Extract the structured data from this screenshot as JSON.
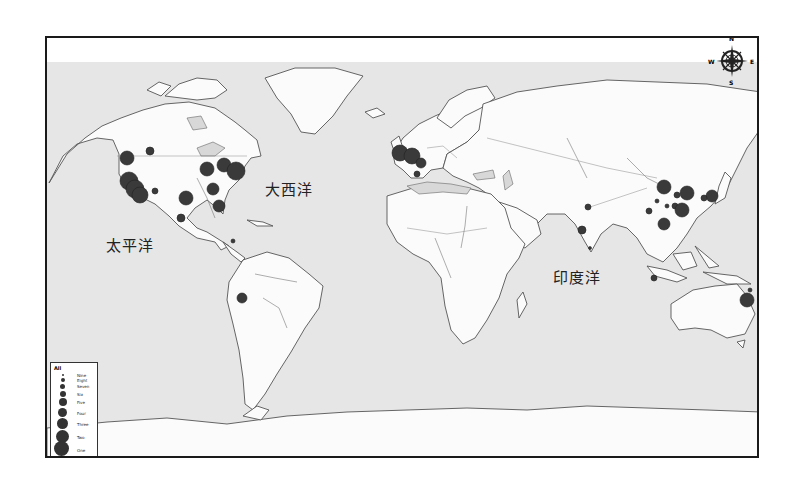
{
  "map": {
    "ocean_labels": {
      "pacific": "太平洋",
      "atlantic": "大西洋",
      "indian": "印度洋"
    },
    "colors": {
      "ocean": "#e6e6e6",
      "land": "#fbfbfb",
      "point": "#3a3a3a",
      "frame": "#1a1a1a"
    },
    "compass": {
      "n": "N",
      "s": "S",
      "e": "E",
      "w": "W"
    },
    "legend": {
      "title": "All",
      "sizes": [
        {
          "label": "Nine",
          "d": 2
        },
        {
          "label": "Eight",
          "d": 4
        },
        {
          "label": "Seven",
          "d": 5
        },
        {
          "label": "Six",
          "d": 6
        },
        {
          "label": "Five",
          "d": 8
        },
        {
          "label": "Four",
          "d": 9
        },
        {
          "label": "Three",
          "d": 11
        },
        {
          "label": "Two",
          "d": 13
        },
        {
          "label": "One",
          "d": 16
        }
      ],
      "extras": [
        "Rivers",
        "Lakes",
        "Continents"
      ]
    },
    "points": [
      {
        "region": "North America",
        "x": 80,
        "y": 120,
        "r": 7
      },
      {
        "region": "North America",
        "x": 103,
        "y": 113,
        "r": 4
      },
      {
        "region": "North America",
        "x": 82,
        "y": 143,
        "r": 9
      },
      {
        "region": "North America",
        "x": 88,
        "y": 151,
        "r": 9
      },
      {
        "region": "North America",
        "x": 93,
        "y": 157,
        "r": 8
      },
      {
        "region": "North America",
        "x": 108,
        "y": 153,
        "r": 3
      },
      {
        "region": "North America",
        "x": 139,
        "y": 160,
        "r": 7
      },
      {
        "region": "North America",
        "x": 160,
        "y": 131,
        "r": 7
      },
      {
        "region": "North America",
        "x": 177,
        "y": 127,
        "r": 7
      },
      {
        "region": "North America",
        "x": 189,
        "y": 133,
        "r": 9
      },
      {
        "region": "North America",
        "x": 166,
        "y": 151,
        "r": 6
      },
      {
        "region": "North America",
        "x": 172,
        "y": 168,
        "r": 6
      },
      {
        "region": "North America",
        "x": 134,
        "y": 180,
        "r": 4
      },
      {
        "region": "South America",
        "x": 186,
        "y": 203,
        "r": 2
      },
      {
        "region": "South America",
        "x": 195,
        "y": 260,
        "r": 5
      },
      {
        "region": "Europe",
        "x": 353,
        "y": 115,
        "r": 8
      },
      {
        "region": "Europe",
        "x": 365,
        "y": 118,
        "r": 8
      },
      {
        "region": "Europe",
        "x": 374,
        "y": 125,
        "r": 5
      },
      {
        "region": "Europe",
        "x": 370,
        "y": 136,
        "r": 3
      },
      {
        "region": "Asia",
        "x": 541,
        "y": 169,
        "r": 3
      },
      {
        "region": "Asia",
        "x": 535,
        "y": 192,
        "r": 4
      },
      {
        "region": "Asia",
        "x": 543,
        "y": 210,
        "r": 1.5
      },
      {
        "region": "Asia",
        "x": 617,
        "y": 149,
        "r": 7
      },
      {
        "region": "Asia",
        "x": 640,
        "y": 155,
        "r": 7
      },
      {
        "region": "Asia",
        "x": 630,
        "y": 157,
        "r": 3
      },
      {
        "region": "Asia",
        "x": 610,
        "y": 163,
        "r": 2
      },
      {
        "region": "Asia",
        "x": 620,
        "y": 168,
        "r": 2
      },
      {
        "region": "Asia",
        "x": 628,
        "y": 168,
        "r": 3
      },
      {
        "region": "Asia",
        "x": 635,
        "y": 172,
        "r": 7
      },
      {
        "region": "Asia",
        "x": 602,
        "y": 173,
        "r": 3
      },
      {
        "region": "Asia",
        "x": 617,
        "y": 186,
        "r": 6
      },
      {
        "region": "Asia",
        "x": 665,
        "y": 158,
        "r": 6
      },
      {
        "region": "Asia",
        "x": 657,
        "y": 160,
        "r": 3
      },
      {
        "region": "Asia",
        "x": 607,
        "y": 240,
        "r": 3
      },
      {
        "region": "Oceania",
        "x": 700,
        "y": 262,
        "r": 7
      },
      {
        "region": "Oceania",
        "x": 703,
        "y": 252,
        "r": 2
      }
    ]
  }
}
